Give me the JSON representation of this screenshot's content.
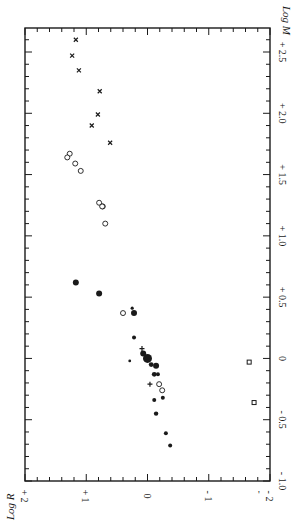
{
  "chart_data": {
    "type": "scatter",
    "title": "",
    "orientation": "rotated 90deg (Log M increases upward along right edge, Log R decreases rightward along bottom)",
    "xlabel": "Log M",
    "ylabel": "Log R",
    "xlim": [
      -1.0,
      2.7
    ],
    "ylim": [
      -2,
      2
    ],
    "x_ticks": [
      "- 1.0",
      "- 0.5",
      "0",
      "+ 0.5",
      "+ 1.0",
      "+ 1.5",
      "+ 2.0",
      "+ 2.5"
    ],
    "x_tick_values": [
      -1.0,
      -0.5,
      0,
      0.5,
      1.0,
      1.5,
      2.0,
      2.5
    ],
    "y_ticks": [
      "+ 2",
      "+ 1",
      "0",
      "- 1",
      "- 2"
    ],
    "y_tick_values": [
      2,
      1,
      0,
      -1,
      -2
    ],
    "grid": false,
    "legend": null,
    "series": [
      {
        "name": "x-marks",
        "marker": "x",
        "points": [
          {
            "logM": 2.6,
            "logR": 1.17
          },
          {
            "logM": 2.47,
            "logR": 1.23
          },
          {
            "logM": 2.35,
            "logR": 1.12
          },
          {
            "logM": 2.18,
            "logR": 0.78
          },
          {
            "logM": 1.99,
            "logR": 0.81
          },
          {
            "logM": 1.9,
            "logR": 0.91
          },
          {
            "logM": 1.76,
            "logR": 0.61
          }
        ]
      },
      {
        "name": "open circles",
        "marker": "open-circle",
        "points": [
          {
            "logM": 1.67,
            "logR": 1.27
          },
          {
            "logM": 1.64,
            "logR": 1.31
          },
          {
            "logM": 1.59,
            "logR": 1.18
          },
          {
            "logM": 1.53,
            "logR": 1.09
          },
          {
            "logM": 1.27,
            "logR": 0.79
          },
          {
            "logM": 1.24,
            "logR": 0.73
          },
          {
            "logM": 1.24,
            "logR": 0.74
          },
          {
            "logM": 1.1,
            "logR": 0.69
          },
          {
            "logM": 0.37,
            "logR": 0.4
          },
          {
            "logM": -0.21,
            "logR": -0.19
          },
          {
            "logM": -0.26,
            "logR": -0.24
          }
        ]
      },
      {
        "name": "filled circles",
        "marker": "filled-circle",
        "points": [
          {
            "logM": 0.62,
            "logR": 1.17,
            "size": 3
          },
          {
            "logM": 0.53,
            "logR": 0.79,
            "size": 3
          },
          {
            "logM": 0.41,
            "logR": 0.25,
            "size": 1.6
          },
          {
            "logM": 0.37,
            "logR": 0.22,
            "size": 3
          },
          {
            "logM": 0.17,
            "logR": 0.22,
            "size": 2
          },
          {
            "logM": 0.04,
            "logR": 0.07,
            "size": 3
          },
          {
            "logM": -0.02,
            "logR": 0.29,
            "size": 1.4
          },
          {
            "logM": 0.0,
            "logR": 0.0,
            "size": 4.5
          },
          {
            "logM": -0.05,
            "logR": -0.06,
            "size": 2.4
          },
          {
            "logM": -0.06,
            "logR": -0.14,
            "size": 3
          },
          {
            "logM": -0.13,
            "logR": -0.11,
            "size": 2.4
          },
          {
            "logM": -0.13,
            "logR": -0.17,
            "size": 2
          },
          {
            "logM": -0.34,
            "logR": -0.11,
            "size": 2
          },
          {
            "logM": -0.32,
            "logR": -0.25,
            "size": 2
          },
          {
            "logM": -0.45,
            "logR": -0.14,
            "size": 2.2
          },
          {
            "logM": -0.61,
            "logR": -0.3,
            "size": 2
          },
          {
            "logM": -0.71,
            "logR": -0.37,
            "size": 2
          }
        ]
      },
      {
        "name": "crosses",
        "marker": "plus",
        "points": [
          {
            "logM": 0.08,
            "logR": 0.09
          },
          {
            "logM": -0.21,
            "logR": -0.04
          }
        ]
      },
      {
        "name": "squares",
        "marker": "open-square",
        "points": [
          {
            "logM": -0.03,
            "logR": -1.66
          },
          {
            "logM": -0.36,
            "logR": -1.74
          }
        ]
      }
    ]
  },
  "axis_titles": {
    "log_m": "Log M",
    "log_r": "Log R"
  },
  "stray_mark": "'"
}
